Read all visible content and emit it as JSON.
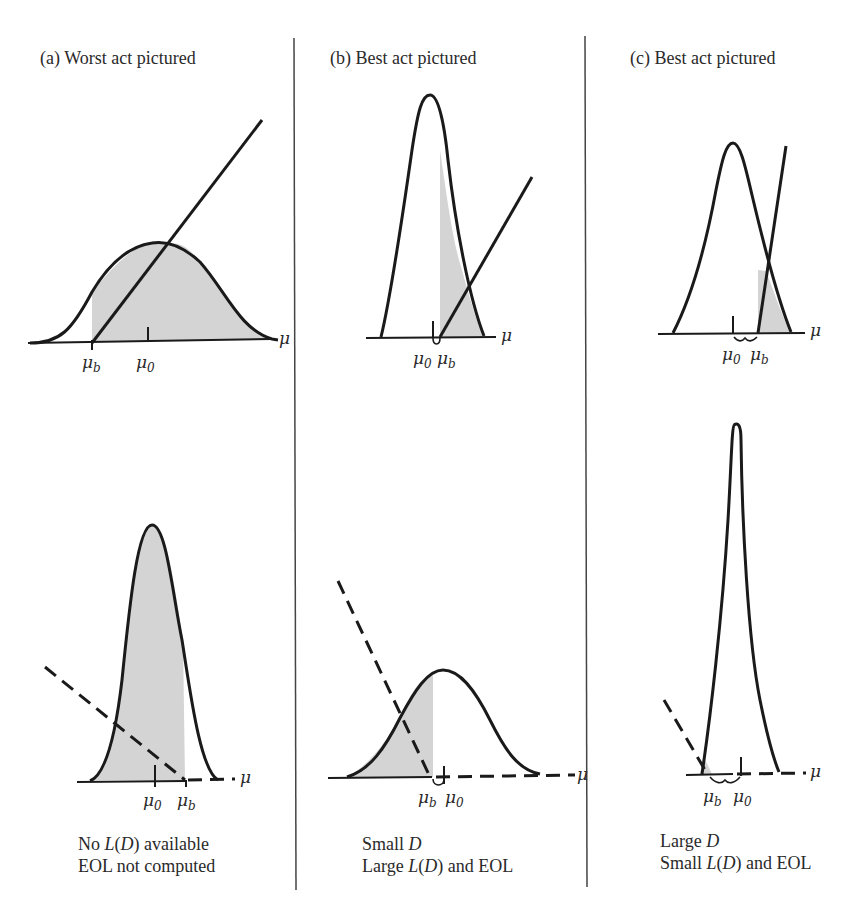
{
  "panels": [
    {
      "id": "a",
      "title": "(a)  Worst act pictured",
      "caption_line1_parts": [
        "No ",
        "L",
        "(",
        "D",
        ") available"
      ],
      "caption_line2": "EOL not computed",
      "top": {
        "axis_label": "μ",
        "mu_b_label": "μ",
        "mu_b_sub": "b",
        "mu_0_label": "μ",
        "mu_0_sub": "0",
        "loss_line": "solid"
      },
      "bottom": {
        "axis_label": "μ",
        "mu_b_label": "μ",
        "mu_b_sub": "b",
        "mu_0_label": "μ",
        "mu_0_sub": "0",
        "loss_line": "dashed"
      }
    },
    {
      "id": "b",
      "title": "(b)  Best act pictured",
      "caption_line1_parts": [
        "Small ",
        "D"
      ],
      "caption_line2_parts": [
        "Large ",
        "L",
        "(",
        "D",
        ") and EOL"
      ],
      "top": {
        "axis_label": "μ",
        "mu_b_label": "μ",
        "mu_b_sub": "b",
        "mu_0_label": "μ",
        "mu_0_sub": "0",
        "loss_line": "solid"
      },
      "bottom": {
        "axis_label": "μ",
        "mu_b_label": "μ",
        "mu_b_sub": "b",
        "mu_0_label": "μ",
        "mu_0_sub": "0",
        "loss_line": "dashed"
      }
    },
    {
      "id": "c",
      "title": "(c)  Best act pictured",
      "caption_line1_parts": [
        "Large ",
        "D"
      ],
      "caption_line2_parts": [
        "Small ",
        "L",
        "(",
        "D",
        ") and EOL"
      ],
      "top": {
        "axis_label": "μ",
        "mu_b_label": "μ",
        "mu_b_sub": "b",
        "mu_0_label": "μ",
        "mu_0_sub": "0",
        "loss_line": "solid"
      },
      "bottom": {
        "axis_label": "μ",
        "mu_b_label": "μ",
        "mu_b_sub": "b",
        "mu_0_label": "μ",
        "mu_0_sub": "0",
        "loss_line": "dashed"
      }
    }
  ],
  "colors": {
    "ink": "#1a1a1a",
    "shade": "#d4d4d4",
    "background": "#ffffff"
  }
}
